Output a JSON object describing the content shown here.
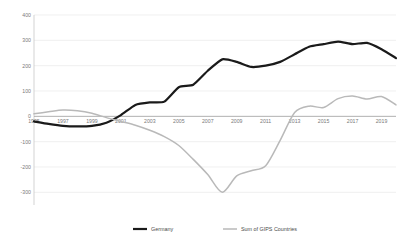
{
  "chart_data": {
    "type": "line",
    "title": "",
    "subtitle": "",
    "xlabel": "",
    "ylabel": "",
    "xlim": [
      1995,
      2020
    ],
    "ylim": [
      -350,
      400
    ],
    "grid": true,
    "legend_position": "bottom",
    "y_ticks": [
      400,
      300,
      200,
      100,
      0,
      -100,
      -200,
      -300
    ],
    "y_tick_labels": [
      "400",
      "300",
      "200",
      "100",
      "0",
      "-100",
      "-200",
      "-300"
    ],
    "x_ticks": [
      1995,
      1997,
      1999,
      2001,
      2003,
      2005,
      2007,
      2009,
      2011,
      2013,
      2015,
      2017,
      2019
    ],
    "x_tick_labels": [
      "1995",
      "1997",
      "1999",
      "2001",
      "2003",
      "2005",
      "2007",
      "2009",
      "2011",
      "2013",
      "2015",
      "2017",
      "2019"
    ],
    "x": [
      1995,
      1996,
      1997,
      1998,
      1999,
      2000,
      2001,
      2002,
      2003,
      2004,
      2005,
      2006,
      2007,
      2008,
      2009,
      2010,
      2011,
      2012,
      2013,
      2014,
      2015,
      2016,
      2017,
      2018,
      2019,
      2020
    ],
    "series": [
      {
        "name": "Germany",
        "color": "#1a1a1a",
        "values": [
          -20,
          -30,
          -38,
          -40,
          -38,
          -25,
          5,
          45,
          55,
          58,
          115,
          125,
          180,
          225,
          215,
          195,
          200,
          215,
          245,
          275,
          285,
          295,
          285,
          290,
          265,
          230
        ]
      },
      {
        "name": "Sum of GIPS Countries",
        "color": "#b9b9b9",
        "values": [
          10,
          18,
          25,
          22,
          12,
          -5,
          -20,
          -35,
          -55,
          -80,
          -115,
          -170,
          -230,
          -300,
          -235,
          -215,
          -195,
          -95,
          15,
          40,
          35,
          70,
          80,
          68,
          78,
          45
        ]
      }
    ],
    "legend": [
      {
        "label": "Germany",
        "color": "#1a1a1a"
      },
      {
        "label": "Sum of GIPS Countries",
        "color": "#b9b9b9"
      }
    ]
  },
  "colors": {
    "germany": "#1a1a1a",
    "gips": "#b9b9b9",
    "gridline": "#e6e6e6",
    "zero_axis": "#9a9a9a",
    "tick_text": "#7a7a7a",
    "background": "#ffffff"
  }
}
